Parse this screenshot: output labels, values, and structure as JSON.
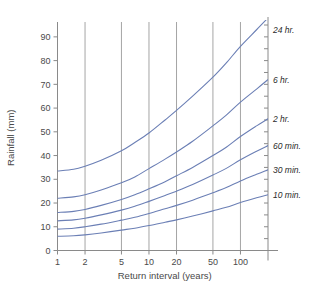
{
  "chart_data": {
    "type": "line",
    "title": "",
    "xlabel": "Return interval  (years)",
    "ylabel": "Rainfall  (mm)",
    "xscale": "log",
    "xlim": [
      1,
      200
    ],
    "ylim": [
      0,
      95
    ],
    "xticks": [
      1,
      2,
      5,
      10,
      20,
      50,
      100
    ],
    "xticklabels": [
      "1",
      "2",
      "5",
      "10",
      "20",
      "50",
      "100"
    ],
    "yticks": [
      0,
      10,
      20,
      30,
      40,
      50,
      60,
      70,
      80,
      90
    ],
    "yticklabels": [
      "0",
      "10",
      "20",
      "30",
      "40",
      "50",
      "60",
      "70",
      "80",
      "90"
    ],
    "grid": "vertical-only",
    "legend_position": "right-of-curve-ends",
    "series": [
      {
        "name": "24 hr.",
        "label": "24 hr.",
        "x": [
          1,
          1.5,
          2,
          3,
          5,
          7,
          10,
          15,
          20,
          30,
          50,
          70,
          100,
          150,
          200
        ],
        "y": [
          33.5,
          34.2,
          35.5,
          38.0,
          42.0,
          45.5,
          49.5,
          55.0,
          59.0,
          65.0,
          73.0,
          79.0,
          86.0,
          93.0,
          98.0
        ]
      },
      {
        "name": "6 hr.",
        "label": "6 hr.",
        "x": [
          1,
          1.5,
          2,
          3,
          5,
          7,
          10,
          15,
          20,
          30,
          50,
          70,
          100,
          150,
          200
        ],
        "y": [
          22.0,
          22.6,
          23.5,
          25.5,
          28.5,
          31.0,
          34.5,
          38.5,
          41.5,
          46.0,
          52.5,
          57.0,
          62.5,
          68.0,
          72.0
        ]
      },
      {
        "name": "2 hr.",
        "label": "2 hr.",
        "x": [
          1,
          1.5,
          2,
          3,
          5,
          7,
          10,
          15,
          20,
          30,
          50,
          70,
          100,
          150,
          200
        ],
        "y": [
          16.0,
          16.5,
          17.3,
          19.0,
          21.5,
          23.5,
          26.0,
          29.0,
          31.5,
          35.0,
          40.0,
          43.5,
          48.0,
          52.5,
          55.5
        ]
      },
      {
        "name": "60 min.",
        "label": "60 min.",
        "x": [
          1,
          1.5,
          2,
          3,
          5,
          7,
          10,
          15,
          20,
          30,
          50,
          70,
          100,
          150,
          200
        ],
        "y": [
          12.5,
          12.9,
          13.6,
          15.0,
          17.0,
          18.6,
          20.7,
          23.2,
          25.0,
          27.8,
          31.8,
          34.6,
          38.2,
          41.8,
          44.2
        ]
      },
      {
        "name": "30 min.",
        "label": "30 min.",
        "x": [
          1,
          1.5,
          2,
          3,
          5,
          7,
          10,
          15,
          20,
          30,
          50,
          70,
          100,
          150,
          200
        ],
        "y": [
          9.0,
          9.4,
          10.0,
          11.1,
          12.8,
          14.0,
          15.6,
          17.6,
          19.0,
          21.2,
          24.3,
          26.5,
          29.3,
          32.1,
          34.0
        ]
      },
      {
        "name": "10 min.",
        "label": "10 min.",
        "x": [
          1,
          1.5,
          2,
          3,
          5,
          7,
          10,
          15,
          20,
          30,
          50,
          70,
          100,
          150,
          200
        ],
        "y": [
          6.0,
          6.2,
          6.6,
          7.4,
          8.6,
          9.4,
          10.5,
          11.9,
          12.9,
          14.5,
          16.7,
          18.2,
          20.2,
          22.2,
          23.5
        ]
      }
    ],
    "colors": {
      "curve": "#6b7fb5",
      "axis": "#8a8a8a",
      "grid": "#9b9b9b",
      "text": "#4a4a4a",
      "background": "#ffffff"
    }
  }
}
